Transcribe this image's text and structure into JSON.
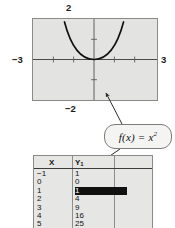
{
  "graph": {
    "labels": {
      "top": "2",
      "bottom": "−2",
      "left": "−3",
      "right": "3"
    },
    "window": {
      "xmin": -3,
      "xmax": 3,
      "ymin": -2,
      "ymax": 2
    }
  },
  "callout": {
    "text_plain": "f(x) = x2",
    "lhs": "f(x) = x",
    "exponent": "2"
  },
  "table": {
    "headers": {
      "x": "X",
      "y_base": "Y",
      "y_sub": "1"
    },
    "rows": [
      {
        "x": "−1",
        "y": "1",
        "highlight": false
      },
      {
        "x": "0",
        "y": "0",
        "highlight": false
      },
      {
        "x": "1",
        "y": "1",
        "highlight": true
      },
      {
        "x": "2",
        "y": "4",
        "highlight": false
      },
      {
        "x": "3",
        "y": "9",
        "highlight": false
      },
      {
        "x": "4",
        "y": "16",
        "highlight": false
      },
      {
        "x": "5",
        "y": "25",
        "highlight": false
      }
    ]
  },
  "chart_data": {
    "type": "line",
    "title": "",
    "xlabel": "",
    "ylabel": "",
    "xlim": [
      -3,
      3
    ],
    "ylim": [
      -2,
      2
    ],
    "grid": false,
    "xticks": [
      -3,
      -2,
      -1,
      0,
      1,
      2,
      3
    ],
    "yticks": [
      -2,
      -1,
      0,
      1,
      2
    ],
    "tick_labels": {
      "left": "−3",
      "right": "3",
      "top": "2",
      "bottom": "−2"
    },
    "series": [
      {
        "name": "f(x) = x^2",
        "expression": "x^2",
        "x": [
          -1.45,
          -1.2,
          -1.0,
          -0.8,
          -0.6,
          -0.4,
          -0.2,
          0,
          0.2,
          0.4,
          0.6,
          0.8,
          1.0,
          1.2,
          1.45
        ],
        "y": [
          2.1,
          1.44,
          1.0,
          0.64,
          0.36,
          0.16,
          0.04,
          0,
          0.04,
          0.16,
          0.36,
          0.64,
          1.0,
          1.44,
          2.1
        ]
      }
    ],
    "annotations": [
      {
        "text": "f(x) = x2",
        "points_to": [
          "graph-curve",
          "table-column-y1"
        ]
      }
    ],
    "table": {
      "columns": [
        "X",
        "Y1"
      ],
      "X": [
        -1,
        0,
        1,
        2,
        3,
        4,
        5
      ],
      "Y1": [
        1,
        0,
        1,
        4,
        9,
        16,
        25
      ],
      "selected_cell": {
        "column": "Y1",
        "row_index": 2,
        "value": "1"
      }
    }
  }
}
